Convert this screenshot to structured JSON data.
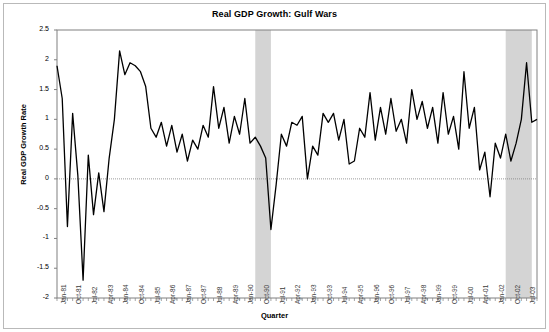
{
  "chart_data": {
    "type": "line",
    "title": "Real GDP Growth: Gulf Wars",
    "xlabel": "Quarter",
    "ylabel": "Real GDP Growth Rate",
    "ylim": [
      -2,
      2.5
    ],
    "ytick_step": 0.5,
    "yticks": [
      "2.5",
      "2",
      "1.5",
      "1",
      "0.5",
      "0",
      "-0.5",
      "-1",
      "-1.5",
      "-2"
    ],
    "grid": false,
    "legend": "none",
    "line_color": "#000000",
    "zero_line_color": "#808080",
    "shaded_band_color": "#d4d4d4",
    "x_start": "Jan-81",
    "x_end": "Jul-03",
    "xtick_labels": [
      "Jan-81",
      "Oct-81",
      "Jul-82",
      "Apr-83",
      "Jan-84",
      "Oct-84",
      "Jul-85",
      "Apr-86",
      "Jan-87",
      "Oct-87",
      "Jul-88",
      "Apr-89",
      "Jan-90",
      "Oct-90",
      "Jul-91",
      "Apr-92",
      "Jan-93",
      "Oct-93",
      "Jul-94",
      "Apr-95",
      "Jan-96",
      "Oct-96",
      "Jul-97",
      "Apr-98",
      "Jan-99",
      "Oct-99",
      "Jul-00",
      "Apr-01",
      "Jan-02",
      "Oct-02",
      "Jul-03"
    ],
    "xtick_interval_points": 3,
    "shaded_bands": [
      {
        "name": "Gulf War I",
        "start_index": 38,
        "end_index": 41
      },
      {
        "name": "Gulf War II",
        "start_index": 86,
        "end_index": 91
      }
    ],
    "values": [
      1.9,
      1.35,
      -0.8,
      1.1,
      0.05,
      -1.7,
      0.4,
      -0.6,
      0.1,
      -0.55,
      0.35,
      1.0,
      2.15,
      1.75,
      1.95,
      1.9,
      1.8,
      1.55,
      0.85,
      0.7,
      0.95,
      0.55,
      0.9,
      0.45,
      0.75,
      0.3,
      0.65,
      0.5,
      0.9,
      0.7,
      1.55,
      0.85,
      1.2,
      0.6,
      1.05,
      0.75,
      1.35,
      0.6,
      0.7,
      0.55,
      0.35,
      -0.85,
      -0.1,
      0.75,
      0.55,
      0.95,
      0.9,
      1.05,
      0.0,
      0.55,
      0.4,
      1.1,
      0.95,
      1.1,
      0.65,
      1.0,
      0.25,
      0.3,
      0.85,
      0.7,
      1.45,
      0.65,
      1.2,
      0.75,
      1.35,
      0.8,
      1.0,
      0.6,
      1.5,
      1.0,
      1.3,
      0.85,
      1.2,
      0.6,
      1.45,
      0.75,
      1.05,
      0.5,
      1.8,
      0.85,
      1.2,
      0.15,
      0.45,
      -0.3,
      0.6,
      0.35,
      0.75,
      0.3,
      0.6,
      1.0,
      1.95,
      0.95,
      1.0
    ]
  }
}
